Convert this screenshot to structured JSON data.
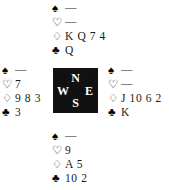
{
  "diagram": {
    "type": "bridge-deal",
    "void_symbol": "—",
    "suits": [
      {
        "key": "spades",
        "symbol": "♠",
        "name": "spade-pip",
        "filled": true
      },
      {
        "key": "hearts",
        "symbol": "♡",
        "name": "heart-pip",
        "filled": false
      },
      {
        "key": "diamonds",
        "symbol": "♢",
        "name": "diamond-pip",
        "filled": false
      },
      {
        "key": "clubs",
        "symbol": "♣",
        "name": "club-pip",
        "filled": true
      }
    ],
    "compass": {
      "north": "N",
      "west": "W",
      "east": "E",
      "south": "S",
      "background": "#111111",
      "text_color": "#ffffff"
    },
    "hands": {
      "north": {
        "label": "North",
        "spades": "—",
        "hearts": "—",
        "diamonds": "K Q 7 4",
        "clubs": "Q"
      },
      "west": {
        "label": "West",
        "spades": "—",
        "hearts": "7",
        "diamonds": "9 8 3",
        "clubs": "3"
      },
      "east": {
        "label": "East",
        "spades": "—",
        "hearts": "—",
        "diamonds": "J 10 6 2",
        "clubs": "K"
      },
      "south": {
        "label": "South",
        "spades": "—",
        "hearts": "9",
        "diamonds": "A 5",
        "clubs": "10 2"
      }
    }
  }
}
